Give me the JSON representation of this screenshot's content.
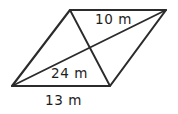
{
  "figure": {
    "shape_name": "parallelogram",
    "stroke_color": "#2b2b2b",
    "background_color": "#ffffff",
    "text_color": "#1d1d1d",
    "labels": {
      "top_edge": "10 m",
      "long_diagonal": "24 m",
      "bottom_edge": "13 m"
    },
    "vertices": {
      "top_left": {
        "x": 70,
        "y": 10
      },
      "top_right": {
        "x": 166,
        "y": 10
      },
      "bottom_right": {
        "x": 110,
        "y": 86
      },
      "bottom_left": {
        "x": 12,
        "y": 86
      }
    },
    "outline_path": "M 70 10 L 166 10 L 110 86 L 12 86 Z",
    "diagonal_long_path": "M 12 86 L 166 10",
    "diagonal_short_path": "M 70 10 L 110 86"
  },
  "chart_data": {
    "type": "diagram",
    "title": "",
    "shape": "parallelogram",
    "annotations": [
      {
        "name": "top-edge-length",
        "text": "10 m",
        "value": 10,
        "unit": "m"
      },
      {
        "name": "long-diagonal-length",
        "text": "24 m",
        "value": 24,
        "unit": "m"
      },
      {
        "name": "bottom-edge-length",
        "text": "13 m",
        "value": 13,
        "unit": "m"
      }
    ]
  }
}
